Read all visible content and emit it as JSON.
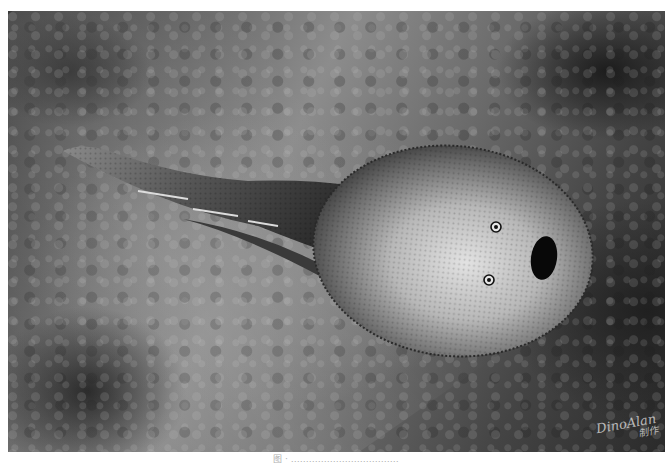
{
  "figure": {
    "style": "grayscale illustration",
    "elements": {
      "tail-fin": "forked tail fin extending to upper-left",
      "head-shield": "rounded tuberculated head shield",
      "eyes": 2,
      "mouth": "dark oval mouth opening at front"
    },
    "colors": {
      "background_dark": "#1c1c1c",
      "background_mid": "#6e6e6e",
      "shield_light": "#d8d8d8",
      "shield_dark": "#3a3a3a"
    }
  },
  "watermark": {
    "line1": "DinoAlan",
    "line2": "制作"
  },
  "caption": {
    "text": "图 · ………………………………"
  }
}
